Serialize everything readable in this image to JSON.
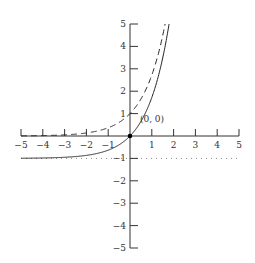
{
  "chart_data": {
    "type": "line",
    "title": "",
    "xlabel": "",
    "ylabel": "",
    "xlim": [
      -5,
      5
    ],
    "ylim": [
      -5,
      5
    ],
    "grid": false,
    "legend": null,
    "x_ticks": [
      -5,
      -4,
      -3,
      -2,
      -1,
      1,
      2,
      3,
      4,
      5
    ],
    "x_tick_labels": [
      "−5",
      "−4",
      "−3",
      "−2",
      "−1",
      "1",
      "2",
      "3",
      "4",
      "5"
    ],
    "y_ticks": [
      5,
      4,
      3,
      2,
      1,
      -1,
      -2,
      -3,
      -4,
      -5
    ],
    "y_tick_labels": [
      "5",
      "4",
      "3",
      "2",
      "1",
      "−1",
      "−2",
      "−3",
      "−4",
      "−5"
    ],
    "series": [
      {
        "name": "y = e^x - 1",
        "style": "solid",
        "function": "exp(x) - 1",
        "x": [
          -5,
          -4,
          -3,
          -2,
          -1,
          0,
          0.5,
          1,
          1.5,
          1.79
        ],
        "y": [
          -0.99,
          -0.98,
          -0.95,
          -0.86,
          -0.63,
          0,
          0.65,
          1.72,
          3.48,
          5
        ]
      },
      {
        "name": "y = e^x",
        "style": "dashed",
        "function": "exp(x)",
        "x": [
          -5,
          -4,
          -3,
          -2,
          -1,
          0,
          0.5,
          1,
          1.5,
          1.61
        ],
        "y": [
          0.007,
          0.018,
          0.05,
          0.14,
          0.37,
          1,
          1.65,
          2.72,
          4.48,
          5
        ]
      },
      {
        "name": "asymptote y = -1",
        "style": "dotted",
        "x": [
          -5,
          5
        ],
        "y": [
          -1,
          -1
        ]
      }
    ],
    "annotations": [
      {
        "text": "(0, 0)",
        "x": 0,
        "y": 0,
        "marker": "filled-dot"
      }
    ]
  },
  "labels": {
    "origin": "(0, 0)"
  }
}
